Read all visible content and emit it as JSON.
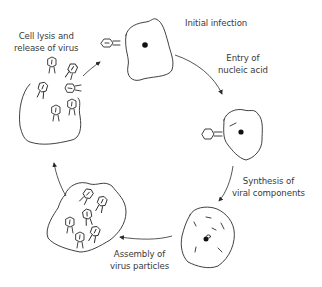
{
  "diagram": {
    "type": "lytic cycle of a bacteriophage",
    "stages": [
      {
        "id": "initial-infection",
        "label": "Initial infection"
      },
      {
        "id": "entry",
        "label_line1": "Entry of",
        "label_line2": "nucleic acid"
      },
      {
        "id": "synthesis",
        "label_line1": "Synthesis of",
        "label_line2": "viral components"
      },
      {
        "id": "assembly",
        "label_line1": "Assembly of",
        "label_line2": "virus particles"
      },
      {
        "id": "lysis",
        "label_line1": "Cell lysis and",
        "label_line2": "release of virus"
      }
    ],
    "colors": {
      "ink": "#2b2b2b",
      "text": "#3a3a3a",
      "background": "#ffffff"
    }
  }
}
